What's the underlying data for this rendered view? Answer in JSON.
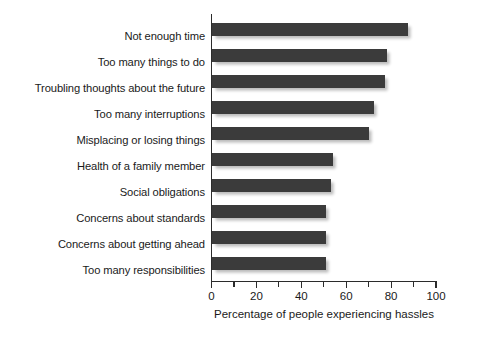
{
  "chart_data": {
    "type": "bar",
    "orientation": "horizontal",
    "title": "",
    "xlabel": "Percentage of people experiencing hassles",
    "ylabel": "",
    "xlim": [
      0,
      100
    ],
    "xticks": [
      0,
      10,
      20,
      30,
      40,
      50,
      60,
      70,
      80,
      90,
      100
    ],
    "xtick_labels": [
      "0",
      "",
      "20",
      "",
      "40",
      "",
      "60",
      "",
      "80",
      "",
      "100"
    ],
    "major_ticks": [
      0,
      20,
      40,
      60,
      80,
      100
    ],
    "grid": false,
    "legend": null,
    "bar_color": "#3b3b3b",
    "categories": [
      "Not enough time",
      "Too many things to do",
      "Troubling thoughts about the future",
      "Too many interruptions",
      "Misplacing or losing things",
      "Health of a family member",
      "Social obligations",
      "Concerns about standards",
      "Concerns about getting ahead",
      "Too many responsibilities"
    ],
    "values": [
      87.5,
      78,
      77,
      72,
      70,
      54,
      53,
      51,
      51,
      51
    ]
  }
}
